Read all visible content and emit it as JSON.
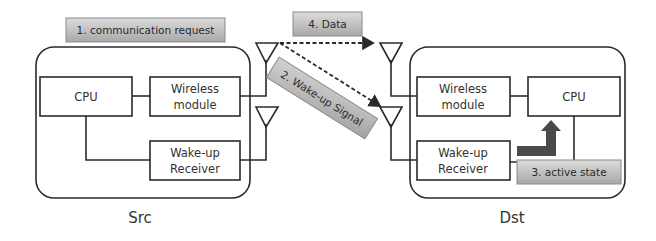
{
  "diagram": {
    "labels": {
      "step1": "1. communication request",
      "step2": "2. Wake-up Signal",
      "step3": "3. active state",
      "step4": "4. Data"
    },
    "src": {
      "title": "Src",
      "cpu": "CPU",
      "wireless_line1": "Wireless",
      "wireless_line2": "module",
      "wakeup_line1": "Wake-up",
      "wakeup_line2": "Receiver"
    },
    "dst": {
      "title": "Dst",
      "cpu": "CPU",
      "wireless_line1": "Wireless",
      "wireless_line2": "module",
      "wakeup_line1": "Wake-up",
      "wakeup_line2": "Receiver"
    },
    "colors": {
      "label_fill_light": "#d8d8d8",
      "label_fill_dark": "#a9a9a9",
      "arrow_dark": "#4a4a4a",
      "line": "#2a2a2a"
    }
  }
}
